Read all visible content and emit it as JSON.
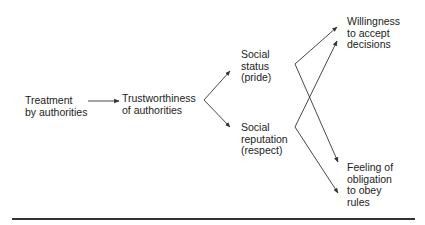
{
  "diagram": {
    "nodes": [
      {
        "id": "treatment",
        "lines": [
          "Treatment",
          "by authorities"
        ]
      },
      {
        "id": "trust",
        "lines": [
          "Trustworthiness",
          "of authorities"
        ]
      },
      {
        "id": "status",
        "lines": [
          "Social",
          "status",
          "(pride)"
        ]
      },
      {
        "id": "reputation",
        "lines": [
          "Social",
          "reputation",
          "(respect)"
        ]
      },
      {
        "id": "willingness",
        "lines": [
          "Willingness",
          "to accept",
          "decisions"
        ]
      },
      {
        "id": "obligation",
        "lines": [
          "Feeling of",
          "obligation",
          "to obey",
          "rules"
        ]
      }
    ],
    "edges": [
      {
        "from": "treatment",
        "to": "trust"
      },
      {
        "from": "trust",
        "to": "status"
      },
      {
        "from": "trust",
        "to": "reputation"
      },
      {
        "from": "status",
        "to": "willingness"
      },
      {
        "from": "status",
        "to": "obligation"
      },
      {
        "from": "reputation",
        "to": "willingness"
      },
      {
        "from": "reputation",
        "to": "obligation"
      }
    ],
    "colors": {
      "line": "#333333",
      "text": "#222222",
      "background": "#ffffff"
    }
  }
}
